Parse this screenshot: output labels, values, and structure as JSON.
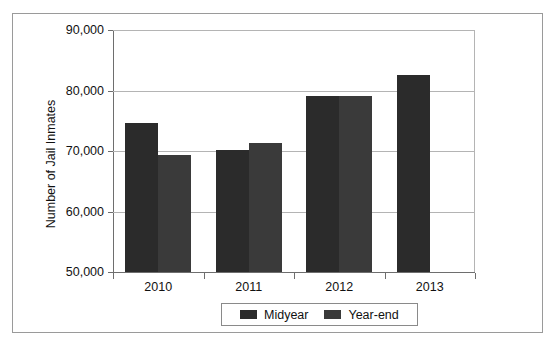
{
  "chart_data": {
    "type": "bar",
    "title": "",
    "subtitle": "",
    "xlabel": "",
    "ylabel": "Number of Jail Inmates",
    "categories": [
      "2010",
      "2011",
      "2012",
      "2013"
    ],
    "ylim": [
      50000,
      90000
    ],
    "ytick_labels": [
      "90,000",
      "80,000",
      "70,000",
      "60,000",
      "50,000"
    ],
    "ytick_values": [
      90000,
      80000,
      70000,
      60000,
      50000
    ],
    "grid": true,
    "legend_position": "bottom-center",
    "series": [
      {
        "name": "Midyear",
        "color": "#2b2b2b",
        "values": [
          74600,
          70100,
          79100,
          82600
        ]
      },
      {
        "name": "Year-end",
        "color": "#3a3a3a",
        "values": [
          69400,
          71300,
          79100,
          null
        ]
      }
    ]
  },
  "axis": {
    "y_title": "Number of Jail Inmates"
  },
  "legend": {
    "items": [
      {
        "label": "Midyear",
        "swatch": "midyear-swatch"
      },
      {
        "label": "Year-end",
        "swatch": "year-end-swatch"
      }
    ]
  }
}
